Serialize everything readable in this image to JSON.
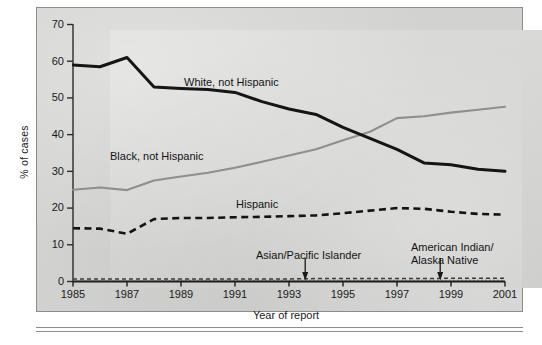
{
  "figure": {
    "panel_name": "hiv-aids-cases-by-race-ethnicity-line-chart",
    "background_color": "#d2d2d0",
    "plot_background_color": "#d8d8d6"
  },
  "chart_data": {
    "type": "line",
    "title": "",
    "xlabel": "Year of report",
    "ylabel": "% of cases",
    "xlim": [
      1985,
      2001
    ],
    "ylim": [
      0,
      70
    ],
    "grid": false,
    "legend": "inline-labels",
    "x": [
      1985,
      1986,
      1987,
      1988,
      1989,
      1990,
      1991,
      1992,
      1993,
      1994,
      1995,
      1996,
      1997,
      1998,
      1999,
      2000,
      2001
    ],
    "xticks": [
      1985,
      1987,
      1989,
      1991,
      1993,
      1995,
      1997,
      1999,
      2001
    ],
    "xtick_labels": [
      "1985",
      "1987",
      "1989",
      "1991",
      "1993",
      "1995",
      "1997",
      "1999",
      "2001"
    ],
    "yticks": [
      0,
      10,
      20,
      30,
      40,
      50,
      60,
      70
    ],
    "ytick_labels": [
      "0",
      "10",
      "20",
      "30",
      "40",
      "50",
      "60",
      "70"
    ],
    "series": [
      {
        "name": "White, not Hispanic",
        "label": "White, not Hispanic",
        "style": "solid-thick",
        "color": "#151515",
        "values": [
          59.0,
          58.5,
          61.0,
          53.0,
          52.6,
          52.3,
          51.5,
          49.0,
          47.0,
          45.5,
          42.0,
          39.0,
          36.0,
          32.3,
          31.8,
          30.6,
          30.0
        ]
      },
      {
        "name": "Black, not Hispanic",
        "label": "Black, not Hispanic",
        "style": "solid-medium",
        "color": "#8f8f8d",
        "values": [
          25.0,
          25.6,
          24.9,
          27.5,
          28.6,
          29.6,
          31.0,
          32.6,
          34.3,
          36.0,
          38.5,
          40.8,
          44.5,
          45.0,
          46.0,
          46.8,
          47.6
        ]
      },
      {
        "name": "Hispanic",
        "label": "Hispanic",
        "style": "dashed-thick",
        "color": "#141414",
        "values": [
          14.5,
          14.4,
          13.0,
          17.0,
          17.3,
          17.3,
          17.5,
          17.6,
          17.8,
          18.0,
          18.6,
          19.3,
          20.0,
          19.8,
          19.0,
          18.4,
          18.2
        ]
      },
      {
        "name": "Asian/Pacific Islander",
        "label": "Asian/Pacific Islander",
        "style": "dashed-thin",
        "color": "#3c3c3c",
        "values": [
          0.7,
          0.7,
          0.7,
          0.7,
          0.7,
          0.7,
          0.7,
          0.7,
          0.7,
          0.8,
          0.8,
          0.8,
          0.8,
          0.8,
          0.9,
          0.9,
          0.9
        ]
      },
      {
        "name": "American Indian/Alaska Native",
        "label": "American Indian/\nAlaska Native",
        "style": "dotted-thin",
        "color": "#5a5a5a",
        "values": [
          0.2,
          0.2,
          0.2,
          0.2,
          0.3,
          0.3,
          0.3,
          0.3,
          0.3,
          0.3,
          0.3,
          0.3,
          0.3,
          0.3,
          0.3,
          0.3,
          0.3
        ]
      }
    ],
    "annotations": [
      {
        "text": "Asian/Pacific Islander",
        "points_to_year": 1993.6,
        "points_to_value": 0.8
      },
      {
        "text_line1": "American Indian/",
        "text_line2": "Alaska Native",
        "points_to_year": 1998.6,
        "points_to_value": 0.3
      }
    ]
  },
  "labels": {
    "white": "White, not Hispanic",
    "black": "Black, not Hispanic",
    "hispanic": "Hispanic",
    "asian": "Asian/Pacific Islander",
    "american_indian_line1": "American Indian/",
    "american_indian_line2": "Alaska Native"
  },
  "axes": {
    "y_title": "% of cases",
    "x_title": "Year of report",
    "y_ticks": [
      "70",
      "60",
      "50",
      "40",
      "30",
      "20",
      "10",
      "0"
    ],
    "x_ticks": [
      "1985",
      "1987",
      "1989",
      "1991",
      "1993",
      "1995",
      "1997",
      "1999",
      "2001"
    ]
  }
}
